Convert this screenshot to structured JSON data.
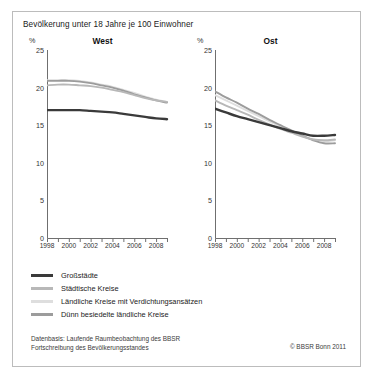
{
  "figure": {
    "title": "Bevölkerung unter 18 Jahre je 100 Einwohner",
    "unit_label": "%",
    "border_color": "#bcbcbc"
  },
  "panels": [
    {
      "key": "west",
      "title": "West"
    },
    {
      "key": "ost",
      "title": "Ost"
    }
  ],
  "legend": {
    "items": [
      {
        "label": "Großstädte",
        "color": "#3a3a3a"
      },
      {
        "label": "Städtische Kreise",
        "color": "#b8b8b8"
      },
      {
        "label": "Ländliche Kreise mit Verdichtungsansätzen",
        "color": "#dedede"
      },
      {
        "label": "Dünn besiedelte ländliche Kreise",
        "color": "#9c9c9c"
      }
    ]
  },
  "footer": {
    "line1": "Datenbasis: Laufende Raumbeobachtung des BBSR",
    "line2": "Fortschreibung des Bevölkerungsstandes",
    "copyright": "© BBSR Bonn 2011"
  },
  "chart_data": {
    "type": "line",
    "title": "Bevölkerung unter 18 Jahre je 100 Einwohner",
    "xlabel": "",
    "ylabel": "%",
    "ylim": [
      0,
      25
    ],
    "yticks": [
      0,
      5,
      10,
      15,
      20,
      25
    ],
    "grid": false,
    "legend_position": "below",
    "x": [
      1998,
      1999,
      2000,
      2001,
      2002,
      2003,
      2004,
      2005,
      2006,
      2007,
      2008,
      2009
    ],
    "xticks": [
      1998,
      2000,
      2002,
      2004,
      2006,
      2008
    ],
    "xlim": [
      1998,
      2009
    ],
    "panels": [
      {
        "name": "West",
        "series": [
          {
            "name": "Großstädte",
            "color": "#3a3a3a",
            "values": [
              17.0,
              17.0,
              17.0,
              17.0,
              16.9,
              16.8,
              16.7,
              16.5,
              16.3,
              16.1,
              15.9,
              15.8
            ]
          },
          {
            "name": "Städtische Kreise",
            "color": "#b8b8b8",
            "values": [
              20.3,
              20.4,
              20.4,
              20.3,
              20.2,
              20.0,
              19.7,
              19.4,
              19.0,
              18.6,
              18.3,
              18.1
            ]
          },
          {
            "name": "Ländliche Kreise mit Verdichtungsansätzen",
            "color": "#dedede",
            "values": [
              21.0,
              21.0,
              21.0,
              20.9,
              20.7,
              20.4,
              20.1,
              19.7,
              19.3,
              18.8,
              18.4,
              18.1
            ]
          },
          {
            "name": "Dünn besiedelte ländliche Kreise",
            "color": "#9c9c9c",
            "values": [
              20.9,
              20.9,
              20.9,
              20.8,
              20.6,
              20.3,
              20.0,
              19.6,
              19.1,
              18.7,
              18.3,
              18.0
            ]
          }
        ]
      },
      {
        "name": "Ost",
        "series": [
          {
            "name": "Großstädte",
            "color": "#3a3a3a",
            "values": [
              17.2,
              16.7,
              16.2,
              15.8,
              15.4,
              15.0,
              14.6,
              14.2,
              13.9,
              13.6,
              13.6,
              13.7
            ]
          },
          {
            "name": "Städtische Kreise",
            "color": "#b8b8b8",
            "values": [
              18.3,
              17.6,
              17.0,
              16.4,
              15.7,
              15.1,
              14.5,
              14.0,
              13.5,
              13.1,
              13.0,
              13.1
            ]
          },
          {
            "name": "Ländliche Kreise mit Verdichtungsansätzen",
            "color": "#dedede",
            "values": [
              19.0,
              18.3,
              17.6,
              16.9,
              16.2,
              15.5,
              14.8,
              14.2,
              13.6,
              13.1,
              12.9,
              13.0
            ]
          },
          {
            "name": "Dünn besiedelte ländliche Kreise",
            "color": "#9c9c9c",
            "values": [
              19.5,
              18.7,
              18.0,
              17.2,
              16.5,
              15.7,
              15.0,
              14.3,
              13.6,
              13.0,
              12.6,
              12.6
            ]
          }
        ]
      }
    ]
  }
}
